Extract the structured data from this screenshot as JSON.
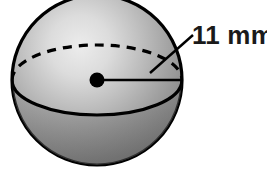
{
  "figure": {
    "type": "geometry-diagram",
    "background_color": "#ffffff",
    "outline_color": "#000000",
    "shading": {
      "style": "radial-gradient",
      "highlight_color": "#e8e8e8",
      "mid_color": "#a8a8a8",
      "shadow_color": "#6e6e6e",
      "edge_color": "#5a5a5a"
    },
    "sphere": {
      "center_x": 97,
      "center_y": 80,
      "radius_px": 85,
      "clipped_edge": "top"
    },
    "equator": {
      "back_arc_style": "dashed",
      "front_arc_style": "solid",
      "dash_pattern": "9 7"
    },
    "center_point": {
      "name": "center-dot",
      "x": 97,
      "y": 80,
      "radius_px": 7,
      "color": "#000000"
    },
    "radius_line": {
      "name": "radius-line",
      "from_x": 97,
      "from_y": 80,
      "to_x": 182,
      "to_y": 80,
      "color": "#000000"
    },
    "leader_line": {
      "name": "leader-line",
      "from_x": 150,
      "from_y": 73,
      "to_x": 192,
      "to_y": 36,
      "color": "#000000"
    },
    "dimension_label": {
      "value": "11",
      "unit": "mm",
      "text": "11 mm",
      "x": 192,
      "y": 44,
      "color": "#1a1a1a"
    }
  }
}
